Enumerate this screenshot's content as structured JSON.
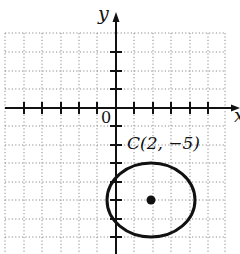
{
  "figure": {
    "type": "coordinate-plane-with-circle",
    "axes": {
      "x_label": "x",
      "y_label": "y",
      "origin_label": "0",
      "grid": true,
      "grid_style": "dotted",
      "x_range_visible": [
        -6,
        6
      ],
      "y_range_visible": [
        -8,
        4
      ]
    },
    "circle": {
      "center_label": "C(2, −5)",
      "center": [
        2,
        -5
      ],
      "radius_approx": 2.2
    },
    "colors": {
      "ink": "#111111",
      "grid": "#888888",
      "background": "#ffffff"
    }
  }
}
